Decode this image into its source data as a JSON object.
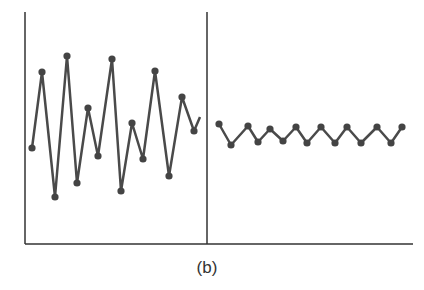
{
  "caption": "(b)",
  "colors": {
    "line": "#4a4a4a",
    "axis": "#333333",
    "marker": "#444444"
  },
  "chart_data": {
    "type": "line",
    "title": "",
    "caption": "(b)",
    "xlabel": "",
    "ylabel": "",
    "grid": false,
    "legend": null,
    "note": "Two panels separated by a vertical divider; left shows large-amplitude irregular oscillation, right shows small-amplitude regular oscillation. No axis ticks or labels. Values are in pixel-derived relative units (0 = bottom axis, higher = up).",
    "ylim": [
      0,
      232
    ],
    "divider_x": 207,
    "series": [
      {
        "name": "left-panel",
        "points": [
          [
            32,
            96
          ],
          [
            42,
            172
          ],
          [
            55,
            47
          ],
          [
            67,
            188
          ],
          [
            77,
            61
          ],
          [
            88,
            136
          ],
          [
            98,
            88
          ],
          [
            112,
            185
          ],
          [
            121,
            53
          ],
          [
            132,
            121
          ],
          [
            143,
            85
          ],
          [
            155,
            173
          ],
          [
            169,
            68
          ],
          [
            182,
            147
          ],
          [
            194,
            113
          ]
        ],
        "tail_to": [
          200,
          127
        ]
      },
      {
        "name": "right-panel",
        "points": [
          [
            219,
            120
          ],
          [
            231,
            99
          ],
          [
            248,
            118
          ],
          [
            258,
            102
          ],
          [
            270,
            115
          ],
          [
            283,
            103
          ],
          [
            296,
            117
          ],
          [
            307,
            101
          ],
          [
            321,
            117
          ],
          [
            335,
            101
          ],
          [
            347,
            117
          ],
          [
            361,
            101
          ],
          [
            377,
            117
          ],
          [
            391,
            101
          ],
          [
            402,
            117
          ]
        ]
      }
    ]
  }
}
